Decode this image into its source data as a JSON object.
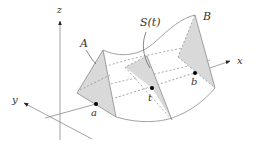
{
  "diagram": {
    "axes": {
      "x_label": "x",
      "y_label": "y",
      "z_label": "z"
    },
    "surface_labels": {
      "A": "A",
      "B": "B",
      "section": "S(t)"
    },
    "points": {
      "a": "a",
      "t": "t",
      "b": "b"
    },
    "colors": {
      "stroke": "#8a8a8a",
      "fill": "#d9d9d9",
      "point": "#000000",
      "text": "#333333"
    }
  }
}
